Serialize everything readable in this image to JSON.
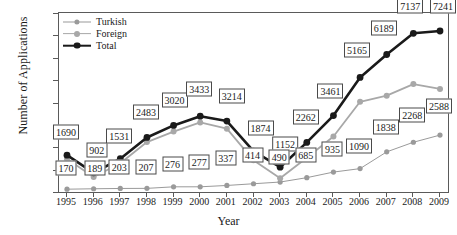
{
  "chart_data": {
    "type": "line",
    "title": "",
    "xlabel": "Year",
    "ylabel": "Number of Applications",
    "categories": [
      "1995",
      "1996",
      "1997",
      "1998",
      "1999",
      "2000",
      "2001",
      "2002",
      "2003",
      "2004",
      "2005",
      "2006",
      "2007",
      "2008",
      "2009"
    ],
    "ylim": [
      0,
      8000
    ],
    "ytick_labels": [
      "0",
      "1000",
      "2000",
      "3000",
      "4000",
      "5000",
      "6000",
      "7000",
      "8000"
    ],
    "ytick_values": [
      0,
      1000,
      2000,
      3000,
      4000,
      5000,
      6000,
      7000,
      8000
    ],
    "grid": false,
    "legend_position": "top-left",
    "series": [
      {
        "name": "Turkish",
        "color": "#9a9a9a",
        "values": [
          170,
          189,
          203,
          207,
          276,
          277,
          337,
          414,
          490,
          685,
          935,
          1090,
          1838,
          2268,
          2588
        ],
        "labeled": true
      },
      {
        "name": "Foreign",
        "color": "#a8a8a8",
        "values": [
          1520,
          713,
          1328,
          2276,
          2744,
          3156,
          2877,
          1460,
          662,
          1577,
          2526,
          4075,
          4351,
          4869,
          4653
        ],
        "labeled": false
      },
      {
        "name": "Total",
        "color": "#1a1a1a",
        "values": [
          1690,
          902,
          1531,
          2483,
          3020,
          3433,
          3214,
          1874,
          1152,
          2262,
          3461,
          5165,
          6189,
          7137,
          7241
        ],
        "labeled": true
      }
    ]
  },
  "legend": {
    "items": [
      {
        "label": "Turkish"
      },
      {
        "label": "Foreign"
      },
      {
        "label": "Total"
      }
    ]
  },
  "axes": {
    "x_title": "Year",
    "y_title": "Number of Applications"
  }
}
